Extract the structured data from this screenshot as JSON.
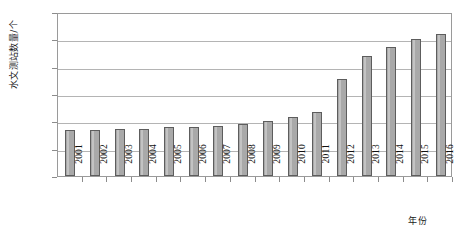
{
  "chart_data": {
    "type": "bar",
    "title": "",
    "subtitle": "",
    "xlabel": "年份",
    "ylabel": "水文测站数量/个",
    "categories": [
      "2001",
      "2002",
      "2003",
      "2004",
      "2005",
      "2006",
      "2007",
      "2008",
      "2009",
      "2010",
      "2011",
      "2012",
      "2013",
      "2014",
      "2015",
      "2016"
    ],
    "values": [
      34000,
      34000,
      34500,
      34500,
      35500,
      36000,
      36500,
      38000,
      40000,
      43000,
      46500,
      71000,
      87500,
      94500,
      100000,
      104000
    ],
    "series": [
      {
        "name": "水文测站数量",
        "values": [
          34000,
          34000,
          34500,
          34500,
          35500,
          36000,
          36500,
          38000,
          40000,
          43000,
          46500,
          71000,
          87500,
          94500,
          100000,
          104000
        ]
      }
    ],
    "ylim": [
      0,
      120000
    ],
    "xlim_categories": 16,
    "y_ticks": [
      0,
      20000,
      40000,
      60000,
      80000,
      100000,
      120000
    ],
    "y_tick_labels": [
      "0",
      "20000",
      "40000",
      "60000",
      "80000",
      "100000",
      "120000"
    ],
    "grid": true,
    "grid_axis": "y",
    "legend": false,
    "legend_position": "none",
    "bar_fill_color": "#a9a9a9",
    "bar_border_color": "#5d5d5d",
    "gridline_color": "#b4b4b4",
    "axis_color": "#9a9a9a",
    "background_color": "#ffffff",
    "text_color": "#111111",
    "bar_width_ratio": 0.42,
    "x_tick_label_rotation": 90
  }
}
